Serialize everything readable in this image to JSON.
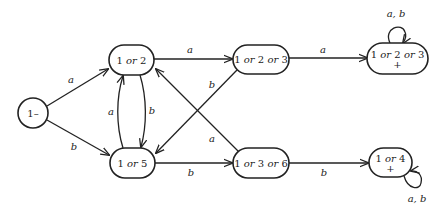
{
  "diagram": {
    "type": "finite-automaton",
    "nodes": [
      {
        "id": "s1",
        "label": "1–",
        "shape": "circle",
        "start": true,
        "final": false
      },
      {
        "id": "s12",
        "label": "1 or 2",
        "shape": "rounded",
        "start": false,
        "final": false
      },
      {
        "id": "s15",
        "label": "1 or 5",
        "shape": "rounded",
        "start": false,
        "final": false
      },
      {
        "id": "s123",
        "label": "1 or 2 or 3",
        "shape": "rounded",
        "start": false,
        "final": false
      },
      {
        "id": "s136",
        "label": "1 or 3 or 6",
        "shape": "rounded",
        "start": false,
        "final": false
      },
      {
        "id": "s123f",
        "label": "1 or 2 or 3",
        "sublabel": "+",
        "shape": "rounded",
        "start": false,
        "final": true
      },
      {
        "id": "s14f",
        "label": "1 or 4",
        "sublabel": "+",
        "shape": "rounded",
        "start": false,
        "final": true
      }
    ],
    "edges": [
      {
        "from": "s1",
        "to": "s12",
        "label": "a"
      },
      {
        "from": "s1",
        "to": "s15",
        "label": "b"
      },
      {
        "from": "s12",
        "to": "s15",
        "label": "b"
      },
      {
        "from": "s15",
        "to": "s12",
        "label": "a"
      },
      {
        "from": "s12",
        "to": "s123",
        "label": "a"
      },
      {
        "from": "s123",
        "to": "s15",
        "label": "b"
      },
      {
        "from": "s136",
        "to": "s12",
        "label": "a"
      },
      {
        "from": "s15",
        "to": "s136",
        "label": "b"
      },
      {
        "from": "s123",
        "to": "s123f",
        "label": "a"
      },
      {
        "from": "s136",
        "to": "s14f",
        "label": "b"
      },
      {
        "from": "s123f",
        "to": "s123f",
        "label": "a, b"
      },
      {
        "from": "s14f",
        "to": "s14f",
        "label": "a, b"
      }
    ]
  },
  "labels": {
    "start": "1–",
    "n12": {
      "a": "1",
      "or": "or",
      "b": "2"
    },
    "n15": {
      "a": "1",
      "or": "or",
      "b": "5"
    },
    "n123": {
      "a": "1",
      "or1": "or",
      "b": "2",
      "or2": "or",
      "c": "3"
    },
    "n136": {
      "a": "1",
      "or1": "or",
      "b": "3",
      "or2": "or",
      "c": "6"
    },
    "n123f": {
      "a": "1",
      "or1": "or",
      "b": "2",
      "or2": "or",
      "c": "3",
      "plus": "+"
    },
    "n14f": {
      "a": "1",
      "or": "or",
      "b": "4",
      "plus": "+"
    },
    "e_s1_s12": "a",
    "e_s1_s15": "b",
    "e_s15_s12": "a",
    "e_s12_s15": "b",
    "e_s12_s123": "a",
    "e_s123_s15": "b",
    "e_s136_s12": "a",
    "e_s15_s136": "b",
    "e_s123_s123f": "a",
    "e_s136_s14f": "b",
    "loop_s123f": "a, b",
    "loop_s14f": "a, b"
  }
}
